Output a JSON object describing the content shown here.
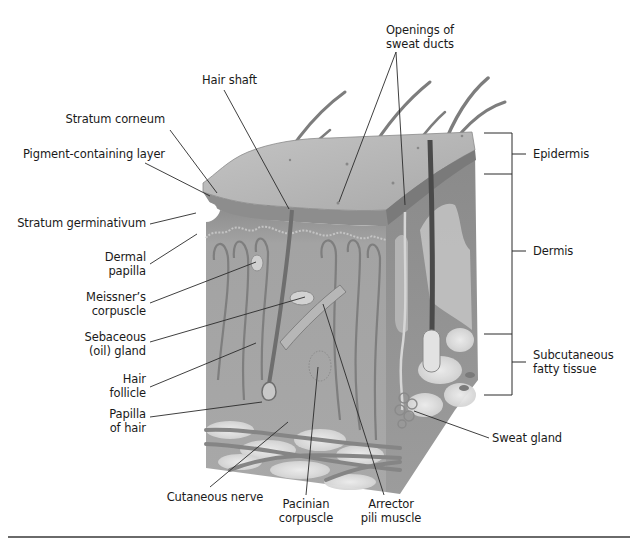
{
  "figure": {
    "colors": {
      "tissue": "#9a9a9a",
      "surface": "#b4b4b4",
      "fat": "#dcdcdc",
      "leader_line": "#2a2a2a",
      "bracket": "#2a2a2a",
      "rule": "#6a6a6a"
    }
  },
  "labels": {
    "openings_of_sweat_ducts": {
      "line1": "Openings of",
      "line2": "sweat ducts"
    },
    "hair_shaft": {
      "line1": "Hair shaft"
    },
    "stratum_corneum": {
      "line1": "Stratum corneum"
    },
    "pigment_containing_layer": {
      "line1": "Pigment-containing layer"
    },
    "stratum_germinativum": {
      "line1": "Stratum germinativum"
    },
    "dermal_papilla": {
      "line1": "Dermal",
      "line2": "papilla"
    },
    "meissners_corpuscle": {
      "line1": "Meissner’s",
      "line2": "corpuscle"
    },
    "sebaceous_gland": {
      "line1": "Sebaceous",
      "line2": "(oil) gland"
    },
    "hair_follicle": {
      "line1": "Hair",
      "line2": "follicle"
    },
    "papilla_of_hair": {
      "line1": "Papilla",
      "line2": "of hair"
    },
    "cutaneous_nerve": {
      "line1": "Cutaneous nerve"
    },
    "pacinian_corpuscle": {
      "line1": "Pacinian",
      "line2": "corpuscle"
    },
    "arrector_pili_muscle": {
      "line1": "Arrector",
      "line2": "pili muscle"
    },
    "sweat_gland": {
      "line1": "Sweat gland"
    }
  },
  "layers": {
    "epidermis": {
      "line1": "Epidermis"
    },
    "dermis": {
      "line1": "Dermis"
    },
    "subcutaneous": {
      "line1": "Subcutaneous",
      "line2": "fatty tissue"
    }
  }
}
